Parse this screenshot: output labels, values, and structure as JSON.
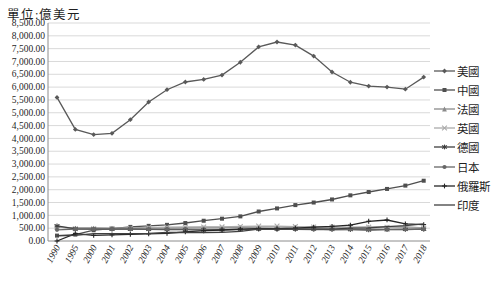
{
  "chart_data": {
    "type": "line",
    "title": "",
    "unit_label": "單位:億美元",
    "x": [
      "1990",
      "1995",
      "2000",
      "2001",
      "2002",
      "2003",
      "2004",
      "2005",
      "2006",
      "2007",
      "2008",
      "2009",
      "2010",
      "2011",
      "2012",
      "2013",
      "2014",
      "2015",
      "2016",
      "2017",
      "2018"
    ],
    "y_ticks": [
      "0.00",
      "500.00",
      "1,000.00",
      "1,500.00",
      "2,000.00",
      "2,500.00",
      "3,000.00",
      "3,500.00",
      "4,000.00",
      "4,500.00",
      "5,000.00",
      "5,500.00",
      "6,000.00",
      "6,500.00",
      "7,000.00",
      "7,500.00",
      "8,000.00",
      "8,500.00"
    ],
    "ylim": [
      0,
      8500
    ],
    "grid": true,
    "legend_position": "right",
    "axis_color": "#8c8c8c",
    "grid_color": "#d9d9d9",
    "text_color": "#1f1f1f",
    "series": [
      {
        "id": "usa",
        "name": "美國",
        "marker": "diamond",
        "color": "#595959",
        "values": [
          5600,
          4350,
          4150,
          4200,
          4730,
          5420,
          5900,
          6200,
          6300,
          6470,
          6970,
          7570,
          7760,
          7640,
          7210,
          6590,
          6190,
          6040,
          6000,
          5920,
          6390
        ]
      },
      {
        "id": "china",
        "name": "中國",
        "marker": "square",
        "color": "#4f4f4f",
        "values": [
          210,
          250,
          420,
          480,
          550,
          590,
          630,
          700,
          790,
          870,
          960,
          1150,
          1270,
          1400,
          1500,
          1620,
          1780,
          1910,
          2030,
          2160,
          2350
        ]
      },
      {
        "id": "france",
        "name": "法國",
        "marker": "triangle",
        "color": "#8a8a8a",
        "values": [
          540,
          505,
          505,
          500,
          510,
          520,
          530,
          525,
          525,
          525,
          530,
          545,
          550,
          540,
          535,
          530,
          530,
          540,
          545,
          550,
          510
        ]
      },
      {
        "id": "uk",
        "name": "英國",
        "marker": "x",
        "color": "#ababab",
        "values": [
          550,
          480,
          480,
          485,
          500,
          520,
          530,
          540,
          545,
          550,
          565,
          580,
          580,
          560,
          545,
          540,
          535,
          540,
          535,
          520,
          500
        ]
      },
      {
        "id": "germany",
        "name": "德國",
        "marker": "asterisk",
        "color": "#3f3f3f",
        "values": [
          590,
          470,
          465,
          460,
          460,
          455,
          450,
          445,
          435,
          435,
          445,
          460,
          465,
          460,
          465,
          450,
          445,
          430,
          440,
          450,
          460
        ]
      },
      {
        "id": "japan",
        "name": "日本",
        "marker": "circle",
        "color": "#666666",
        "values": [
          435,
          460,
          460,
          462,
          463,
          463,
          462,
          461,
          458,
          455,
          455,
          458,
          453,
          455,
          450,
          450,
          455,
          459,
          457,
          455,
          454
        ]
      },
      {
        "id": "russia",
        "name": "俄羅斯",
        "marker": "plus",
        "color": "#262626",
        "values": [
          0,
          290,
          220,
          240,
          260,
          280,
          300,
          360,
          400,
          430,
          460,
          480,
          480,
          500,
          540,
          570,
          620,
          770,
          820,
          670,
          640
        ]
      },
      {
        "id": "india",
        "name": "印度",
        "marker": "none",
        "color": "#404040",
        "values": [
          200,
          220,
          285,
          290,
          285,
          295,
          335,
          330,
          330,
          335,
          380,
          460,
          460,
          460,
          460,
          465,
          500,
          510,
          560,
          600,
          665
        ]
      }
    ]
  }
}
